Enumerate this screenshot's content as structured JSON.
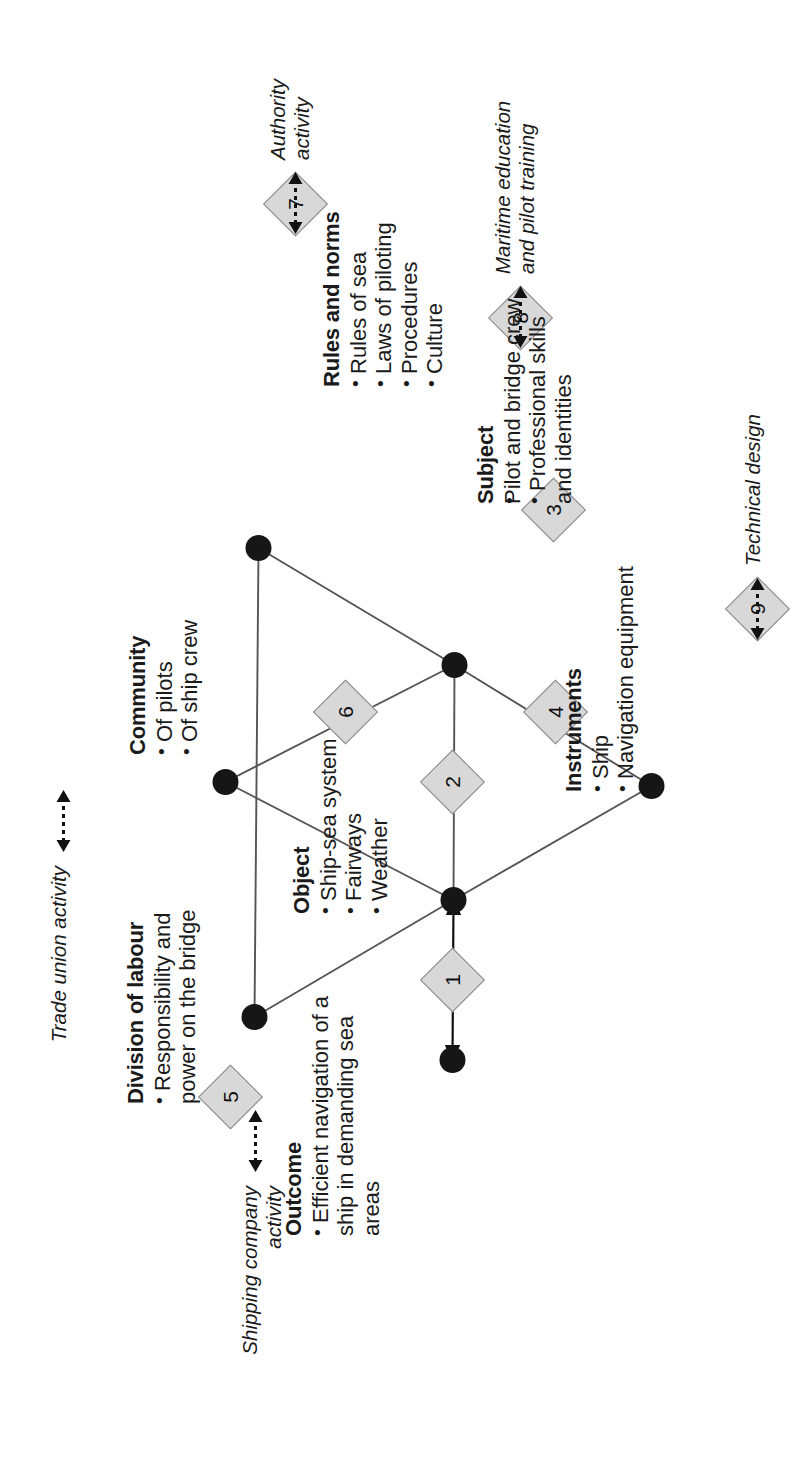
{
  "diagram": {
    "type": "activity-system-triangle",
    "orientation": "rotated-90-ccw",
    "nodes": {
      "outcome": {
        "label": "Outcome",
        "bullets": [
          "Efficient navigation of a ship in demanding sea areas"
        ]
      },
      "object": {
        "label": "Object",
        "bullets": [
          "Ship-sea system",
          "Fairways",
          "Weather"
        ]
      },
      "instruments": {
        "label": "Instruments",
        "bullets": [
          "Ship",
          "Navigation equipment"
        ]
      },
      "subject": {
        "label": "Subject",
        "bullets": [
          "Pilot and bridge crew",
          "Professional skills and identities"
        ]
      },
      "rules": {
        "label": "Rules and norms",
        "bullets": [
          "Rules of sea",
          "Laws of piloting",
          "Procedures",
          "Culture"
        ]
      },
      "community": {
        "label": "Community",
        "bullets": [
          "Of pilots",
          "Of ship crew"
        ]
      },
      "division": {
        "label": "Division of labour",
        "bullets": [
          "Responsibility and power on the bridge"
        ]
      }
    },
    "contradictions": [
      {
        "id": "1",
        "number": "1"
      },
      {
        "id": "2",
        "number": "2"
      },
      {
        "id": "3",
        "number": "3"
      },
      {
        "id": "4",
        "number": "4"
      },
      {
        "id": "5",
        "number": "5"
      },
      {
        "id": "6",
        "number": "6"
      },
      {
        "id": "7",
        "number": "7"
      },
      {
        "id": "8",
        "number": "8"
      },
      {
        "id": "9",
        "number": "9"
      }
    ],
    "neighbour_activities": [
      {
        "id": "shipping",
        "lines": [
          "Shipping company",
          "activity"
        ],
        "diamond": "5"
      },
      {
        "id": "trade-union",
        "lines": [
          "Trade union activity"
        ],
        "diamond": ""
      },
      {
        "id": "technical-design",
        "lines": [
          "Technical design"
        ],
        "diamond": "9"
      },
      {
        "id": "maritime-education",
        "lines": [
          "Maritime education",
          "and pilot training"
        ],
        "diamond": "8"
      },
      {
        "id": "authority",
        "lines": [
          "Authority",
          "activity"
        ],
        "diamond": "7"
      }
    ],
    "bullets_text": {
      "outcome_b1_l1": "Efficient navigation of a",
      "outcome_b1_l2": "ship in demanding sea",
      "outcome_b1_l3": "areas",
      "object_b1": "Ship-sea system",
      "object_b2": "Fairways",
      "object_b3": "Weather",
      "instruments_b1": "Ship",
      "instruments_b2": "Navigation equipment",
      "subject_b1": "Pilot and bridge crew",
      "subject_b2_l1": "Professional skills",
      "subject_b2_l2": "and identities",
      "rules_b1": "Rules of sea",
      "rules_b2": "Laws of piloting",
      "rules_b3": "Procedures",
      "rules_b4": "Culture",
      "community_b1": "Of pilots",
      "community_b2": "Of ship crew",
      "division_b1_l1": "Responsibility and",
      "division_b1_l2": "power on the bridge"
    },
    "external_text": {
      "shipping_l1": "Shipping company",
      "shipping_l2": "activity",
      "trade_union_l1": "Trade union activity",
      "technical_design_l1": "Technical design",
      "maritime_l1": "Maritime education",
      "maritime_l2": "and pilot training",
      "authority_l1": "Authority",
      "authority_l2": "activity"
    },
    "colors": {
      "node_fill": "#161616",
      "edge_stroke": "#555555",
      "diamond_fill": "#d8d8d8",
      "diamond_stroke": "#8a8a8a",
      "text": "#1a1a1a",
      "background": "#ffffff"
    }
  }
}
